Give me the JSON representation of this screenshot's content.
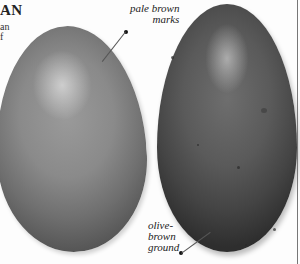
{
  "page": {
    "heading_fragment": "AN",
    "body_fragment_lines": [
      "an",
      "f"
    ]
  },
  "figure": {
    "eggs": [
      {
        "id": "left",
        "tone": "pale",
        "color": "#8a8a8a"
      },
      {
        "id": "right",
        "tone": "dark",
        "color": "#555555"
      }
    ],
    "labels": {
      "pale_brown_marks": {
        "line1": "pale brown",
        "line2": "marks"
      },
      "olive_brown_ground": {
        "line1": "olive-",
        "line2": "brown",
        "line3": "ground"
      }
    }
  }
}
